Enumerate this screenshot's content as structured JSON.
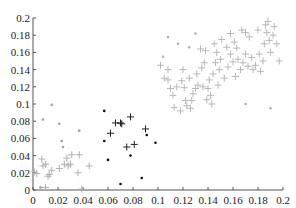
{
  "chart_data": {
    "type": "scatter",
    "title": "",
    "xlabel": "",
    "ylabel": "",
    "xlim": [
      0,
      0.2
    ],
    "ylim": [
      0,
      0.2
    ],
    "grid": false,
    "legend": null,
    "x_ticks": [
      "0",
      "0.02",
      "0.04",
      "0.06",
      "0.08",
      "0.1",
      "0.12",
      "0.14",
      "0.16",
      "0.18",
      "0.2"
    ],
    "y_ticks": [
      "0",
      "0.02",
      "0.04",
      "0.06",
      "0.08",
      "0.1",
      "0.12",
      "0.14",
      "0.16",
      "0.18",
      "0.2"
    ],
    "series": [
      {
        "name": "cluster-low-light-crosses",
        "marker": "+",
        "color": "#b0b0b0",
        "points": [
          [
            0.001,
            0.021
          ],
          [
            0.003,
            0.019
          ],
          [
            0.007,
            0.036
          ],
          [
            0.008,
            0.028
          ],
          [
            0.01,
            0.03
          ],
          [
            0.012,
            0.016
          ],
          [
            0.013,
            0.018
          ],
          [
            0.015,
            0.023
          ],
          [
            0.021,
            0.025
          ],
          [
            0.025,
            0.03
          ],
          [
            0.027,
            0.037
          ],
          [
            0.028,
            0.028
          ],
          [
            0.03,
            0.03
          ],
          [
            0.031,
            0.041
          ],
          [
            0.036,
            0.02
          ],
          [
            0.037,
            0.041
          ],
          [
            0.045,
            0.028
          ],
          [
            0.01,
            0.003
          ],
          [
            0.039,
            0.001
          ]
        ]
      },
      {
        "name": "cluster-low-light-dots",
        "marker": "dot",
        "color": "#a0a0a0",
        "points": [
          [
            0.015,
            0.099
          ],
          [
            0.008,
            0.082
          ],
          [
            0.021,
            0.077
          ],
          [
            0.037,
            0.069
          ],
          [
            0.023,
            0.057
          ],
          [
            0.024,
            0.05
          ],
          [
            0.006,
            0.003
          ]
        ]
      },
      {
        "name": "cluster-mid-dark-crosses",
        "marker": "+",
        "color": "#222222",
        "points": [
          [
            0.066,
            0.078
          ],
          [
            0.07,
            0.078
          ],
          [
            0.071,
            0.077
          ],
          [
            0.078,
            0.085
          ],
          [
            0.062,
            0.066
          ],
          [
            0.075,
            0.05
          ],
          [
            0.081,
            0.053
          ],
          [
            0.09,
            0.071
          ]
        ]
      },
      {
        "name": "cluster-mid-dark-dots",
        "marker": "dot",
        "color": "#111111",
        "points": [
          [
            0.057,
            0.092
          ],
          [
            0.057,
            0.057
          ],
          [
            0.06,
            0.035
          ],
          [
            0.07,
            0.007
          ],
          [
            0.087,
            0.014
          ],
          [
            0.078,
            0.04
          ],
          [
            0.091,
            0.064
          ],
          [
            0.098,
            0.055
          ]
        ]
      },
      {
        "name": "cluster-high-light-crosses",
        "marker": "+",
        "color": "#b8b8b8",
        "points": [
          [
            0.102,
            0.145
          ],
          [
            0.105,
            0.13
          ],
          [
            0.108,
            0.128
          ],
          [
            0.11,
            0.118
          ],
          [
            0.112,
            0.11
          ],
          [
            0.113,
            0.096
          ],
          [
            0.115,
            0.12
          ],
          [
            0.118,
            0.092
          ],
          [
            0.12,
            0.14
          ],
          [
            0.121,
            0.119
          ],
          [
            0.122,
            0.104
          ],
          [
            0.123,
            0.098
          ],
          [
            0.125,
            0.13
          ],
          [
            0.126,
            0.095
          ],
          [
            0.127,
            0.104
          ],
          [
            0.128,
            0.112
          ],
          [
            0.13,
            0.118
          ],
          [
            0.132,
            0.122
          ],
          [
            0.134,
            0.164
          ],
          [
            0.135,
            0.142
          ],
          [
            0.136,
            0.12
          ],
          [
            0.138,
            0.162
          ],
          [
            0.14,
            0.118
          ],
          [
            0.141,
            0.128
          ],
          [
            0.142,
            0.11
          ],
          [
            0.143,
            0.1
          ],
          [
            0.145,
            0.17
          ],
          [
            0.146,
            0.148
          ],
          [
            0.147,
            0.16
          ],
          [
            0.148,
            0.122
          ],
          [
            0.15,
            0.152
          ],
          [
            0.151,
            0.175
          ],
          [
            0.153,
            0.13
          ],
          [
            0.155,
            0.166
          ],
          [
            0.156,
            0.143
          ],
          [
            0.158,
            0.158
          ],
          [
            0.16,
            0.149
          ],
          [
            0.161,
            0.172
          ],
          [
            0.162,
            0.132
          ],
          [
            0.164,
            0.152
          ],
          [
            0.166,
            0.14
          ],
          [
            0.168,
            0.148
          ],
          [
            0.17,
            0.158
          ],
          [
            0.172,
            0.144
          ],
          [
            0.173,
            0.178
          ],
          [
            0.175,
            0.154
          ],
          [
            0.176,
            0.14
          ],
          [
            0.178,
            0.145
          ],
          [
            0.18,
            0.186
          ],
          [
            0.181,
            0.158
          ],
          [
            0.182,
            0.138
          ],
          [
            0.184,
            0.15
          ],
          [
            0.185,
            0.17
          ],
          [
            0.186,
            0.192
          ],
          [
            0.187,
            0.183
          ],
          [
            0.188,
            0.196
          ],
          [
            0.189,
            0.174
          ],
          [
            0.19,
            0.16
          ],
          [
            0.192,
            0.18
          ],
          [
            0.193,
            0.19
          ],
          [
            0.195,
            0.17
          ],
          [
            0.197,
            0.15
          ],
          [
            0.163,
            0.165
          ],
          [
            0.158,
            0.182
          ],
          [
            0.167,
            0.186
          ],
          [
            0.17,
            0.183
          ],
          [
            0.149,
            0.14
          ],
          [
            0.144,
            0.135
          ],
          [
            0.137,
            0.148
          ],
          [
            0.131,
            0.135
          ],
          [
            0.119,
            0.127
          ],
          [
            0.108,
            0.14
          ],
          [
            0.139,
            0.105
          ]
        ]
      },
      {
        "name": "cluster-high-light-dots",
        "marker": "dot",
        "color": "#b0b0b0",
        "points": [
          [
            0.108,
            0.178
          ],
          [
            0.116,
            0.17
          ],
          [
            0.13,
            0.182
          ],
          [
            0.125,
            0.166
          ],
          [
            0.104,
            0.155
          ],
          [
            0.17,
            0.1
          ],
          [
            0.19,
            0.095
          ]
        ]
      }
    ]
  }
}
